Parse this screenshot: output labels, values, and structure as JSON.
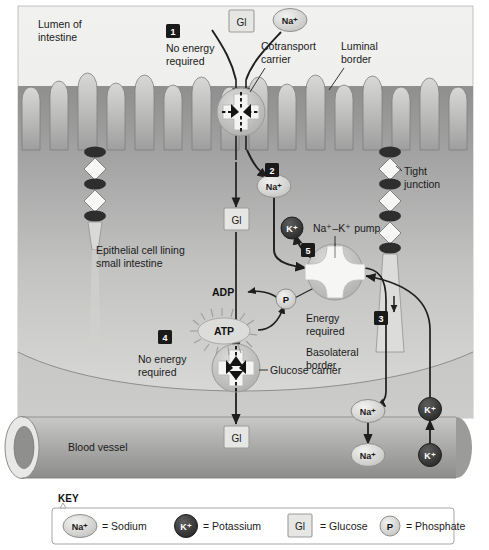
{
  "figure": {
    "background_color": "#ffffff",
    "panel_border_color": "#9a9a9a"
  },
  "labels": {
    "lumen": "Lumen of\nintestine",
    "lumen_line1": "Lumen of",
    "lumen_line2": "intestine",
    "cotransport_carrier_line1": "Cotransport",
    "cotransport_carrier_line2": "carrier",
    "luminal_border_line1": "Luminal",
    "luminal_border_line2": "border",
    "tight_junction_line1": "Tight",
    "tight_junction_line2": "junction",
    "epithelial_line1": "Epithelial cell lining",
    "epithelial_line2": "small intestine",
    "na_k_pump": "Na⁺–K⁺ pump",
    "basolateral_line1": "Basolateral",
    "basolateral_line2": "border",
    "glucose_carrier": "Glucose carrier",
    "blood_vessel": "Blood vessel",
    "no_energy_line1": "No energy",
    "no_energy_line2": "required",
    "energy_line1": "Energy",
    "energy_line2": "required",
    "adp": "ADP",
    "atp": "ATP"
  },
  "steps": [
    {
      "id": "1",
      "number": "1",
      "caption_line1": "No energy",
      "caption_line2": "required"
    },
    {
      "id": "2",
      "number": "2",
      "caption_line1": "",
      "caption_line2": ""
    },
    {
      "id": "3",
      "number": "3",
      "caption_line1": "",
      "caption_line2": ""
    },
    {
      "id": "4",
      "number": "4",
      "caption_line1": "No energy",
      "caption_line2": "required"
    },
    {
      "id": "5",
      "number": "5",
      "caption_line1": "",
      "caption_line2": ""
    }
  ],
  "molecules": {
    "sodium": "Na⁺",
    "potassium": "K⁺",
    "glucose": "Gl",
    "phosphate": "P",
    "adp": "ADP",
    "atp": "ATP"
  },
  "key": {
    "heading": "KEY",
    "entries": [
      {
        "symbol": "Na⁺",
        "type": "na",
        "text": "= Sodium"
      },
      {
        "symbol": "K⁺",
        "type": "k",
        "text": "= Potassium"
      },
      {
        "symbol": "Gl",
        "type": "gl",
        "text": "= Glucose"
      },
      {
        "symbol": "P",
        "type": "p",
        "text": "= Phosphate"
      }
    ]
  },
  "colors": {
    "lumen_bg": "#ececea",
    "cell_body": "#a8a8a8",
    "cell_body_light": "#d2d2d0",
    "vessel": "#a9a9a9",
    "na_fill": "#d8d8d6",
    "k_fill": "#3c3c3c",
    "gl_fill": "#e2e2e0",
    "tight_dark": "#2e2e2e",
    "tight_light": "#f5f5f3",
    "arrow": "#1f1f1f",
    "step_box": "#1a1a1a"
  }
}
